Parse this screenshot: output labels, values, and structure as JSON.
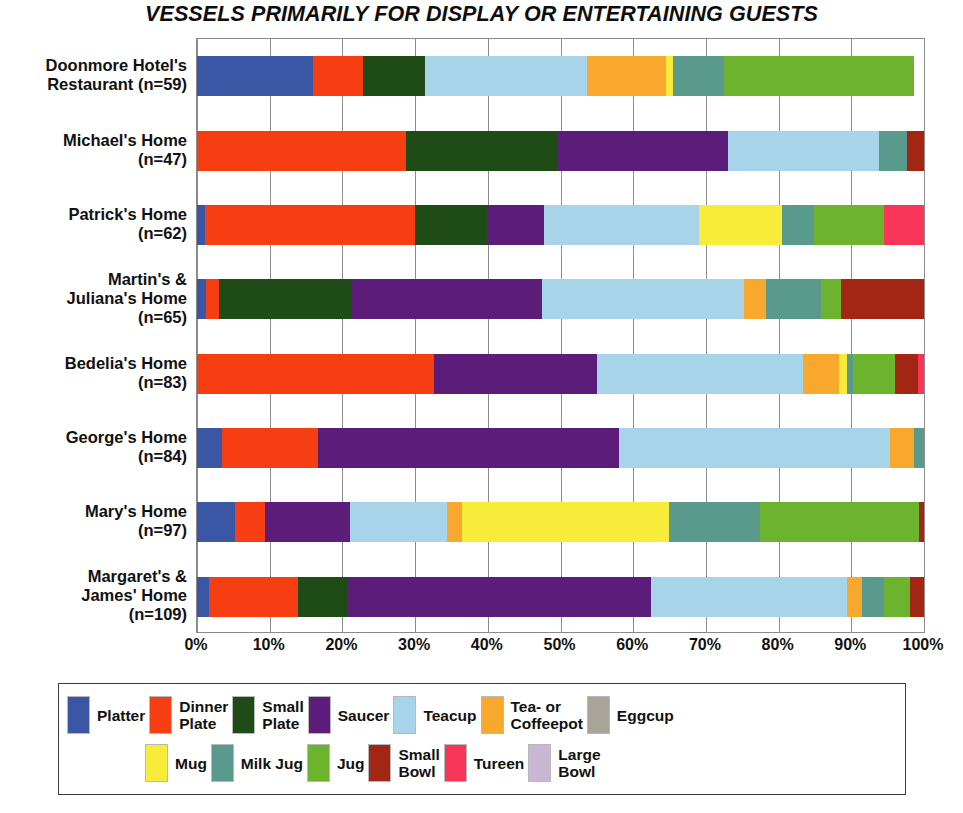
{
  "chart_data": {
    "type": "bar",
    "orientation": "horizontal",
    "stacked": true,
    "normalized": "percent",
    "title": "VESSELS PRIMARILY FOR DISPLAY OR ENTERTAINING GUESTS",
    "xlabel": "",
    "ylabel": "",
    "xlim": [
      0,
      100
    ],
    "grid": true,
    "legend_position": "bottom",
    "xticks": [
      "0%",
      "10%",
      "20%",
      "30%",
      "40%",
      "50%",
      "60%",
      "70%",
      "80%",
      "90%",
      "100%"
    ],
    "xtick_values": [
      0,
      10,
      20,
      30,
      40,
      50,
      60,
      70,
      80,
      90,
      100
    ],
    "categories": [
      "Doonmore Hotel's\nRestaurant (n=59)",
      "Michael's Home\n(n=47)",
      "Patrick's Home\n(n=62)",
      "Martin's &\nJuliana's Home\n(n=65)",
      "Bedelia's Home\n(n=83)",
      "George's Home\n(n=84)",
      "Mary's Home\n(n=97)",
      "Margaret's &\nJames' Home\n(n=109)"
    ],
    "category_counts": [
      59,
      47,
      62,
      65,
      83,
      84,
      97,
      109
    ],
    "series": [
      {
        "name": "Platter",
        "color": "#3a56a5",
        "values": [
          16.0,
          0.0,
          1.1,
          1.2,
          0.0,
          3.4,
          5.2,
          1.6
        ]
      },
      {
        "name": "Dinner Plate",
        "color": "#f63e12",
        "values": [
          6.9,
          28.8,
          28.9,
          1.8,
          32.6,
          13.2,
          4.1,
          12.3
        ]
      },
      {
        "name": "Small Plate",
        "color": "#1f4b16",
        "values": [
          8.5,
          20.9,
          9.9,
          18.3,
          0.0,
          0.0,
          0.0,
          6.8
        ]
      },
      {
        "name": "Saucer",
        "color": "#5c1c7a",
        "values": [
          0.0,
          23.3,
          7.8,
          26.2,
          22.4,
          41.4,
          11.7,
          41.7
        ]
      },
      {
        "name": "Teacup",
        "color": "#a8d4ea",
        "values": [
          22.3,
          20.8,
          21.4,
          27.7,
          28.4,
          37.3,
          13.4,
          27.0
        ]
      },
      {
        "name": "Tea- or Coffeepot",
        "color": "#f9a82e",
        "values": [
          10.8,
          0.0,
          0.0,
          3.1,
          4.9,
          3.3,
          2.0,
          2.1
        ]
      },
      {
        "name": "Eggcup",
        "color": "#a8a499",
        "values": [
          0.0,
          0.0,
          0.0,
          0.0,
          0.0,
          0.0,
          0.0,
          0.0
        ]
      },
      {
        "name": "Mug",
        "color": "#f7ec3a",
        "values": [
          1.0,
          0.0,
          11.4,
          0.0,
          1.1,
          0.0,
          28.5,
          0.0
        ]
      },
      {
        "name": "Milk Jug",
        "color": "#599a8c",
        "values": [
          7.0,
          3.9,
          4.4,
          7.6,
          0.9,
          1.4,
          12.6,
          3.0
        ]
      },
      {
        "name": "Jug",
        "color": "#6cb42e",
        "values": [
          26.2,
          0.0,
          9.6,
          2.7,
          5.7,
          0.0,
          21.8,
          3.6
        ]
      },
      {
        "name": "Small Bowl",
        "color": "#a32614",
        "values": [
          0.0,
          2.3,
          0.0,
          11.4,
          3.2,
          0.0,
          0.7,
          1.9
        ]
      },
      {
        "name": "Tureen",
        "color": "#f63558",
        "values": [
          0.0,
          0.0,
          5.5,
          0.0,
          0.8,
          0.0,
          0.0,
          0.0
        ]
      },
      {
        "name": "Large Bowl",
        "color": "#c8b6d4",
        "values": [
          0.0,
          0.0,
          0.0,
          0.0,
          0.0,
          0.0,
          0.0,
          0.0
        ]
      }
    ]
  },
  "legend": {
    "row1": [
      {
        "label": "Platter",
        "color": "#3a56a5"
      },
      {
        "label": "Dinner\nPlate",
        "color": "#f63e12"
      },
      {
        "label": "Small\nPlate",
        "color": "#1f4b16"
      },
      {
        "label": "Saucer",
        "color": "#5c1c7a"
      },
      {
        "label": "Teacup",
        "color": "#a8d4ea"
      },
      {
        "label": "Tea- or\nCoffeepot",
        "color": "#f9a82e"
      },
      {
        "label": "Eggcup",
        "color": "#a8a499"
      }
    ],
    "row2": [
      {
        "label": "Mug",
        "color": "#f7ec3a"
      },
      {
        "label": "Milk Jug",
        "color": "#599a8c"
      },
      {
        "label": "Jug",
        "color": "#6cb42e"
      },
      {
        "label": "Small\nBowl",
        "color": "#a32614"
      },
      {
        "label": "Tureen",
        "color": "#f63558"
      },
      {
        "label": "Large\nBowl",
        "color": "#c8b6d4"
      }
    ]
  }
}
